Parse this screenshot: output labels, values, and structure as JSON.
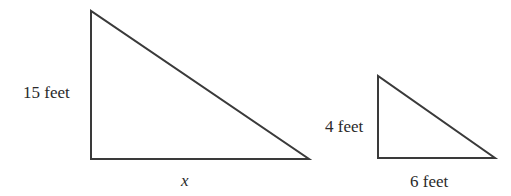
{
  "diagram": {
    "stroke_color": "#3a3a3a",
    "text_color": "#2a2a2a",
    "large_triangle": {
      "vertical_leg_label": "15 feet",
      "horizontal_leg_label": "x",
      "points": {
        "top": [
          91,
          11
        ],
        "right_angle": [
          91,
          159
        ],
        "right": [
          309,
          159
        ]
      }
    },
    "small_triangle": {
      "vertical_leg_label": "4 feet",
      "horizontal_leg_label": "6 feet",
      "points": {
        "top": [
          378,
          76
        ],
        "right_angle": [
          378,
          158
        ],
        "right": [
          495,
          158
        ]
      }
    }
  }
}
